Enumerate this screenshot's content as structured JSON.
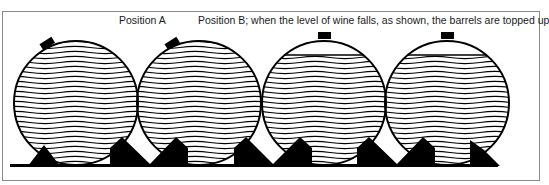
{
  "labels": {
    "position_a": "Position A",
    "position_b": "Position B; when the level of wine falls, as shown, the barrels are topped up"
  },
  "barrels": [
    {
      "id": 1,
      "position": "A",
      "bung": "tilted",
      "filled": "full"
    },
    {
      "id": 2,
      "position": "A",
      "bung": "tilted",
      "filled": "full"
    },
    {
      "id": 3,
      "position": "B",
      "bung": "top",
      "filled": "partial"
    },
    {
      "id": 4,
      "position": "B",
      "bung": "top",
      "filled": "partial"
    }
  ],
  "colors": {
    "ink": "#000000",
    "frame": "#8a8a8a",
    "background": "#ffffff"
  }
}
